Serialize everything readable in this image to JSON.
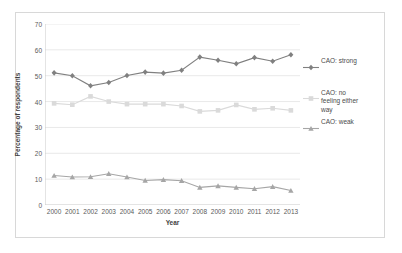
{
  "chart_data": {
    "type": "line",
    "title": "",
    "subtitle": "",
    "xlabel": "Year",
    "ylabel": "Percentage of respondents",
    "categories": [
      "2000",
      "2001",
      "2002",
      "2003",
      "2004",
      "2005",
      "2006",
      "2007",
      "2008",
      "2009",
      "2010",
      "2011",
      "2012",
      "2013"
    ],
    "x": [
      2000,
      2001,
      2002,
      2003,
      2004,
      2005,
      2006,
      2007,
      2008,
      2009,
      2010,
      2011,
      2012,
      2013
    ],
    "ylim": [
      0,
      70
    ],
    "yticks": [
      0,
      10,
      20,
      30,
      40,
      50,
      60,
      70
    ],
    "grid": "horizontal",
    "legend_position": "right",
    "series": [
      {
        "name": "CAO: strong",
        "color": "#808080",
        "marker": "diamond",
        "values": [
          51.1,
          50.0,
          46.1,
          47.4,
          50.1,
          51.4,
          51.0,
          52.1,
          57.2,
          56.0,
          54.6,
          57.0,
          55.6,
          58.1
        ]
      },
      {
        "name": "CAO: no feeling either way",
        "color": "#dadada",
        "marker": "square",
        "values": [
          39.3,
          38.8,
          42.0,
          40.0,
          39.0,
          39.0,
          39.0,
          38.3,
          36.2,
          36.6,
          38.7,
          37.0,
          37.4,
          36.6
        ]
      },
      {
        "name": "CAO: weak",
        "color": "#a6a6a6",
        "marker": "triangle",
        "values": [
          11.4,
          10.8,
          10.9,
          12.1,
          10.8,
          9.5,
          9.8,
          9.4,
          6.8,
          7.4,
          6.8,
          6.3,
          7.1,
          5.6
        ]
      }
    ]
  },
  "legend": {
    "entries": [
      {
        "label": "CAO: strong"
      },
      {
        "label": "CAO: no\nfeeling either\nway"
      },
      {
        "label": "CAO: weak"
      }
    ]
  },
  "axes": {
    "y_tick_labels": [
      "70",
      "60",
      "50",
      "40",
      "30",
      "20",
      "10",
      "0"
    ],
    "x_tick_labels": [
      "2000",
      "2001",
      "2002",
      "2003",
      "2004",
      "2005",
      "2006",
      "2007",
      "2008",
      "2009",
      "2010",
      "2011",
      "2012",
      "2013"
    ],
    "y_title": "Percentage of respondents",
    "x_title": "Year"
  },
  "colors": {
    "strong": "#808080",
    "neutral": "#dadada",
    "weak": "#a6a6a6",
    "grid": "#e9e9e9",
    "axis": "#c9c9c9",
    "frame": "#d8d8d8",
    "tick_text": "#5a5a5a",
    "title_text": "#3f3f3f"
  }
}
